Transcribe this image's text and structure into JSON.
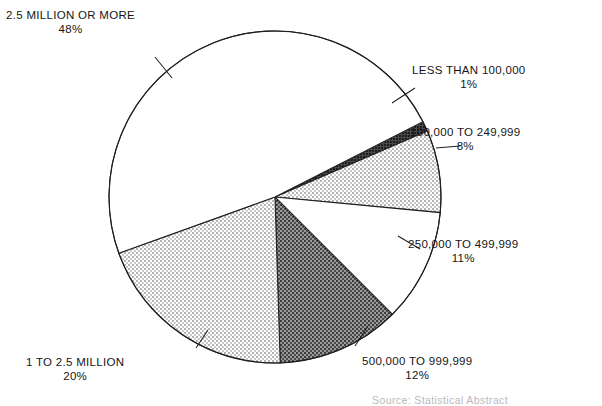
{
  "chart_data": {
    "type": "pie",
    "title": "",
    "subtitle": "",
    "xlabel": "",
    "ylabel": "",
    "legend_position": "callout-labels",
    "grid": false,
    "units": "percent",
    "categories": [
      "LESS THAN 100,000",
      "100,000 TO 249,999",
      "250,000 TO 499,999",
      "500,000 TO 999,999",
      "1 TO 2.5 MILLION",
      "2.5 MILLION OR MORE"
    ],
    "values": [
      1,
      8,
      11,
      12,
      20,
      48
    ],
    "value_labels": [
      "1%",
      "8%",
      "11%",
      "12%",
      "20%",
      "48%"
    ],
    "slices": [
      {
        "label": "LESS THAN 100,000",
        "percent_label": "1%",
        "value": 1,
        "fill": "dark",
        "color": "#3a3a3a",
        "start_deg": 63.0,
        "end_deg": 66.6
      },
      {
        "label": "100,000 TO 249,999",
        "percent_label": "8%",
        "value": 8,
        "fill": "light",
        "color": "#d8d8d8",
        "start_deg": 66.6,
        "end_deg": 95.4
      },
      {
        "label": "250,000 TO 499,999",
        "percent_label": "11%",
        "value": 11,
        "fill": "white",
        "color": "#ffffff",
        "start_deg": 95.4,
        "end_deg": 135.0
      },
      {
        "label": "500,000 TO 999,999",
        "percent_label": "12%",
        "value": 12,
        "fill": "dark",
        "color": "#6e6e6e",
        "start_deg": 135.0,
        "end_deg": 178.2
      },
      {
        "label": "1 TO 2.5 MILLION",
        "percent_label": "20%",
        "value": 20,
        "fill": "light",
        "color": "#d8d8d8",
        "start_deg": 178.2,
        "end_deg": 250.2
      },
      {
        "label": "2.5 MILLION OR MORE",
        "percent_label": "48%",
        "value": 48,
        "fill": "white",
        "color": "#ffffff",
        "start_deg": 250.2,
        "end_deg": 423.0
      }
    ],
    "geometry": {
      "center_x": 275,
      "center_y": 197,
      "radius": 166
    }
  },
  "callouts": {
    "more_2_5m": {
      "label": "2.5 MILLION OR MORE",
      "percent": "48%"
    },
    "less_100k": {
      "label": "LESS THAN 100,000",
      "percent": "1%"
    },
    "from_100k": {
      "label": "100,000 TO 249,999",
      "percent": "8%"
    },
    "from_250k": {
      "label": "250,000 TO 499,999",
      "percent": "11%"
    },
    "from_500k": {
      "label": "500,000 TO 999,999",
      "percent": "12%"
    },
    "from_1m": {
      "label": "1 TO 2.5 MILLION",
      "percent": "20%"
    }
  },
  "footer": {
    "source_line": "Source: Statistical Abstract"
  },
  "colors": {
    "stroke": "#1f1f1f",
    "light_fill": "#d8d8d8",
    "dark_fill": "#6e6e6e",
    "darkest_fill": "#3a3a3a",
    "white_fill": "#ffffff",
    "text": "#151515"
  }
}
